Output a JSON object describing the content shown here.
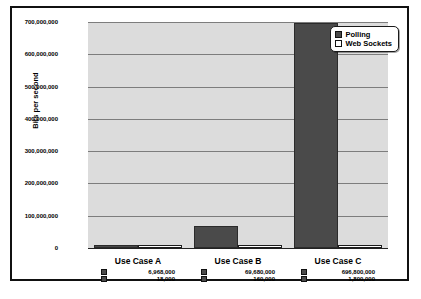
{
  "chart_data": {
    "type": "bar",
    "title": "",
    "xlabel": "",
    "ylabel": "Bits per second",
    "ylim": [
      0,
      700000000
    ],
    "grid": true,
    "legend_position": "top-right",
    "categories": [
      "Use Case A",
      "Use Case B",
      "Use Case C"
    ],
    "series": [
      {
        "name": "Polling",
        "color": "#4a4a4a",
        "values": [
          6968000,
          69680000,
          696800000
        ],
        "value_labels": [
          "6,968,000",
          "69,680,000",
          "696,800,000"
        ]
      },
      {
        "name": "Web Sockets",
        "color": "#ffffff",
        "values": [
          18000,
          160000,
          1800000
        ],
        "value_labels": [
          "18,000",
          "160,000",
          "1,800,000"
        ]
      }
    ],
    "y_ticks": [
      0,
      100000000,
      200000000,
      300000000,
      400000000,
      500000000,
      600000000,
      700000000
    ],
    "y_tick_labels": [
      "0",
      "100,000,000",
      "200,000,000",
      "300,000,000",
      "400,000,000",
      "500,000,000",
      "600,000,000",
      "700,000,000"
    ]
  },
  "legend": {
    "items": [
      {
        "label": "Polling",
        "swatch": "polling"
      },
      {
        "label": "Web Sockets",
        "swatch": "websockets"
      }
    ]
  },
  "colors": {
    "polling": "#4a4a4a",
    "websockets": "#ffffff",
    "plot_background": "#dcdcdc",
    "gridline": "#7d7d7d",
    "frame": "#111111"
  }
}
